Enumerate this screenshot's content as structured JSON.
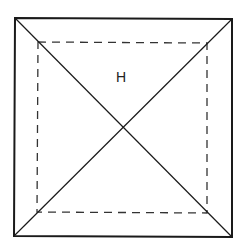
{
  "diagram": {
    "type": "square-pyramid-top-view",
    "label": "H",
    "outer_square": {
      "corners": {
        "top_left": [
          15,
          18
        ],
        "top_right": [
          232,
          19
        ],
        "bottom_right": [
          232,
          237
        ],
        "bottom_left": [
          14,
          236
        ]
      },
      "stroke": "#1a1a1a",
      "stroke_width": 2
    },
    "inner_square": {
      "style": "dashed",
      "corners": {
        "top_left": [
          38,
          42
        ],
        "top_right": [
          207,
          43
        ],
        "bottom_right": [
          207,
          213
        ],
        "bottom_left": [
          37,
          212
        ]
      },
      "stroke": "#333333",
      "stroke_width": 1.3,
      "dash_pattern": "8 6"
    },
    "diagonals": [
      {
        "from": [
          15,
          18
        ],
        "to": [
          232,
          237
        ]
      },
      {
        "from": [
          232,
          19
        ],
        "to": [
          14,
          236
        ]
      }
    ],
    "label_position": [
      121,
      82
    ],
    "colors": {
      "background": "#ffffff",
      "line": "#1a1a1a"
    }
  }
}
